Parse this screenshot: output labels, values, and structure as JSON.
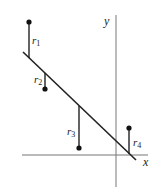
{
  "diagram": {
    "axes": {
      "x_label": "x",
      "y_label": "y"
    },
    "residuals": [
      {
        "label": "r",
        "sub": "1"
      },
      {
        "label": "r",
        "sub": "2"
      },
      {
        "label": "r",
        "sub": "3"
      },
      {
        "label": "r",
        "sub": "4"
      }
    ],
    "colors": {
      "ink": "#222222",
      "axis": "#777777"
    }
  }
}
